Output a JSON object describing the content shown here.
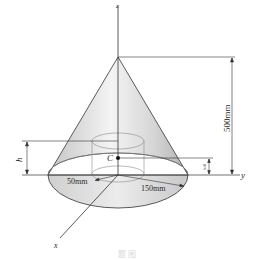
{
  "figure": {
    "axes": {
      "x_label": "x",
      "y_label": "y",
      "z_label": "z"
    },
    "point_label": "C",
    "dimensions": {
      "height_total": "500mm",
      "centroid_height": "h",
      "quarter_height": "h/4",
      "inner_radius": "50mm",
      "outer_radius": "150mm"
    },
    "colors": {
      "cone_fill_light": "#f2f2f2",
      "cone_fill_dark": "#b9b9b9",
      "base_fill": "#dcdcdc",
      "line": "#333333",
      "hidden_line": "#8a8a8a"
    },
    "caption": "题 图"
  }
}
